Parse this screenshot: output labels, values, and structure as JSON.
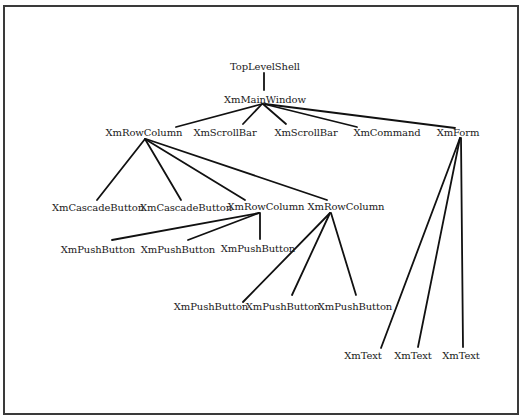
{
  "diagram": {
    "title": "",
    "type": "widget-hierarchy-tree",
    "nodes": [
      {
        "id": "n0",
        "label": "TopLevelShell",
        "x": 265,
        "y": 61
      },
      {
        "id": "n1",
        "label": "XmMainWindow",
        "x": 265,
        "y": 94
      },
      {
        "id": "n2",
        "label": "XmRowColumn",
        "x": 144,
        "y": 127
      },
      {
        "id": "n3",
        "label": "XmScrollBar",
        "x": 225,
        "y": 127
      },
      {
        "id": "n4",
        "label": "XmScrollBar",
        "x": 306,
        "y": 127
      },
      {
        "id": "n5",
        "label": "XmCommand",
        "x": 387,
        "y": 127
      },
      {
        "id": "n6",
        "label": "XmForm",
        "x": 458,
        "y": 127
      },
      {
        "id": "n7",
        "label": "XmCascadeButton",
        "x": 98,
        "y": 202
      },
      {
        "id": "n8",
        "label": "XmCascadeButton",
        "x": 186,
        "y": 202
      },
      {
        "id": "n9",
        "label": "XmRowColumn",
        "x": 266,
        "y": 201
      },
      {
        "id": "n10",
        "label": "XmRowColumn",
        "x": 346,
        "y": 201
      },
      {
        "id": "n11",
        "label": "XmPushButton",
        "x": 98,
        "y": 244
      },
      {
        "id": "n12",
        "label": "XmPushButton",
        "x": 178,
        "y": 244
      },
      {
        "id": "n13",
        "label": "XmPushButton",
        "x": 258,
        "y": 243
      },
      {
        "id": "n14",
        "label": "XmPushButton",
        "x": 211,
        "y": 301
      },
      {
        "id": "n15",
        "label": "XmPushButton",
        "x": 283,
        "y": 301
      },
      {
        "id": "n16",
        "label": "XmPushButton",
        "x": 355,
        "y": 301
      },
      {
        "id": "n17",
        "label": "XmText",
        "x": 363,
        "y": 350
      },
      {
        "id": "n18",
        "label": "XmText",
        "x": 413,
        "y": 350
      },
      {
        "id": "n19",
        "label": "XmText",
        "x": 461,
        "y": 350
      }
    ],
    "edges": [
      {
        "from": "n0",
        "to": "n1",
        "x1": 264,
        "y1": 73,
        "x2": 264,
        "y2": 90
      },
      {
        "from": "n1",
        "to": "n2",
        "x1": 262,
        "y1": 104,
        "x2": 176,
        "y2": 127
      },
      {
        "from": "n1",
        "to": "n3",
        "x1": 262,
        "y1": 104,
        "x2": 243,
        "y2": 124
      },
      {
        "from": "n1",
        "to": "n4",
        "x1": 263,
        "y1": 104,
        "x2": 286,
        "y2": 124
      },
      {
        "from": "n1",
        "to": "n5",
        "x1": 264,
        "y1": 104,
        "x2": 357,
        "y2": 127
      },
      {
        "from": "n1",
        "to": "n6",
        "x1": 265,
        "y1": 104,
        "x2": 455,
        "y2": 128
      },
      {
        "from": "n2",
        "to": "n7",
        "x1": 145,
        "y1": 139,
        "x2": 97,
        "y2": 200
      },
      {
        "from": "n2",
        "to": "n8",
        "x1": 145,
        "y1": 139,
        "x2": 181,
        "y2": 200
      },
      {
        "from": "n2",
        "to": "n9",
        "x1": 145,
        "y1": 139,
        "x2": 245,
        "y2": 200
      },
      {
        "from": "n2",
        "to": "n10",
        "x1": 146,
        "y1": 139,
        "x2": 327,
        "y2": 200
      },
      {
        "from": "n6",
        "to": "n17",
        "x1": 460,
        "y1": 138,
        "x2": 381,
        "y2": 348
      },
      {
        "from": "n6",
        "to": "n18",
        "x1": 460,
        "y1": 138,
        "x2": 418,
        "y2": 347
      },
      {
        "from": "n6",
        "to": "n19",
        "x1": 461,
        "y1": 138,
        "x2": 463,
        "y2": 347
      },
      {
        "from": "n9",
        "to": "n11",
        "x1": 259,
        "y1": 213,
        "x2": 112,
        "y2": 240
      },
      {
        "from": "n9",
        "to": "n12",
        "x1": 259,
        "y1": 213,
        "x2": 188,
        "y2": 240
      },
      {
        "from": "n9",
        "to": "n13",
        "x1": 260,
        "y1": 213,
        "x2": 260,
        "y2": 239
      },
      {
        "from": "n10",
        "to": "n14",
        "x1": 330,
        "y1": 213,
        "x2": 243,
        "y2": 302
      },
      {
        "from": "n10",
        "to": "n15",
        "x1": 330,
        "y1": 213,
        "x2": 292,
        "y2": 295
      },
      {
        "from": "n10",
        "to": "n16",
        "x1": 331,
        "y1": 213,
        "x2": 356,
        "y2": 295
      }
    ]
  },
  "colors": {
    "background": "#ffffff",
    "frame": "#3a3a3a",
    "lines": "#111111",
    "text": "#1a1a1a"
  }
}
